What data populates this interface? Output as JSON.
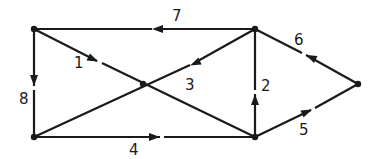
{
  "diagram": {
    "type": "directed-graph",
    "colors": {
      "stroke": "#1a1a1a",
      "background": "#ffffff"
    },
    "nodes": [
      {
        "id": "A",
        "x": 34,
        "y": 29
      },
      {
        "id": "B",
        "x": 255,
        "y": 29
      },
      {
        "id": "C",
        "x": 143,
        "y": 84
      },
      {
        "id": "D",
        "x": 34,
        "y": 137
      },
      {
        "id": "E",
        "x": 255,
        "y": 137
      },
      {
        "id": "F",
        "x": 358,
        "y": 84
      }
    ],
    "edges": [
      {
        "label": "1",
        "from": "A",
        "to": "C"
      },
      {
        "label": "2",
        "from": "E",
        "to": "B"
      },
      {
        "label": "3",
        "from": "B",
        "to": "C"
      },
      {
        "label": "4",
        "from": "D",
        "to": "E"
      },
      {
        "label": "5",
        "from": "E",
        "to": "F"
      },
      {
        "label": "6",
        "from": "F",
        "to": "B"
      },
      {
        "label": "7",
        "from": "B",
        "to": "A"
      },
      {
        "label": "8",
        "from": "A",
        "to": "D"
      }
    ],
    "undirected_lines": [
      {
        "from": "D",
        "to": "C",
        "note": "continues C to B as diagonal"
      },
      {
        "from": "C",
        "to": "E"
      }
    ],
    "labels": {
      "e1": "1",
      "e2": "2",
      "e3": "3",
      "e4": "4",
      "e5": "5",
      "e6": "6",
      "e7": "7",
      "e8": "8"
    }
  }
}
